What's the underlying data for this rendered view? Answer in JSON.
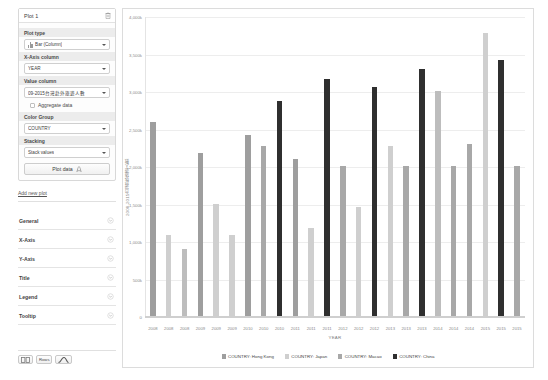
{
  "sidebar": {
    "plot_card": {
      "title": "Plot 1",
      "delete_icon": "trash-icon",
      "fields": [
        {
          "label": "Plot type",
          "value": "Bar (Column)",
          "icon": "bar-chart-icon"
        },
        {
          "label": "X-Axis column",
          "value": "YEAR"
        },
        {
          "label": "Value column",
          "value": "09-2015台灣赴外旅遊人數"
        },
        {
          "label": "Color Group",
          "value": "COUNTRY"
        },
        {
          "label": "Stacking",
          "value": "Stack values"
        }
      ],
      "checkbox": {
        "label": "Aggregate data",
        "checked": false
      },
      "plot_button": {
        "label": "Plot data",
        "icon": "rocket-icon"
      }
    },
    "add_new_plot": "Add new plot",
    "sections": [
      {
        "label": "General",
        "expanded": false
      },
      {
        "label": "X-Axis",
        "expanded": false
      },
      {
        "label": "Y-Axis",
        "expanded": false
      },
      {
        "label": "Title",
        "expanded": false
      },
      {
        "label": "Legend",
        "expanded": false
      },
      {
        "label": "Tooltip",
        "expanded": false
      }
    ],
    "bottom_buttons": [
      {
        "name": "grid-view-button",
        "glyph": "▮▮"
      },
      {
        "name": "rows-button",
        "glyph": "Rows"
      },
      {
        "name": "chart-view-button",
        "glyph": "chart-icon"
      }
    ]
  },
  "colors": {
    "hong_kong": "#9e9e9e",
    "japan": "#cfcfcf",
    "macao": "#a8a8a8",
    "china": "#2f2f2f",
    "gridline": "#ededed",
    "axis": "#cfcfcf"
  },
  "chart_data": {
    "type": "bar",
    "title": "",
    "xlabel": "YEAR",
    "ylabel": "2008-2015台灣赴外旅遊人數",
    "ylim": [
      0,
      4000
    ],
    "yticks": [
      0,
      500,
      1000,
      1500,
      2000,
      2500,
      3000,
      3500,
      4000
    ],
    "ytick_labels": [
      "0",
      "500k",
      "1,000k",
      "1,500k",
      "2,000k",
      "2,500k",
      "3,000k",
      "3,500k",
      "4,000k"
    ],
    "grid": true,
    "legend_position": "bottom",
    "unit": "k",
    "categories": [
      "2008",
      "2008",
      "2008",
      "2009",
      "2009",
      "2009",
      "2010",
      "2010",
      "2010",
      "2011",
      "2011",
      "2011",
      "2012",
      "2012",
      "2012",
      "2013",
      "2013",
      "2013",
      "2014",
      "2014",
      "2014",
      "2015",
      "2015",
      "2015"
    ],
    "legend": [
      {
        "label": "COUNTRY: Hong Kong",
        "color": "#9e9e9e"
      },
      {
        "label": "COUNTRY: Japan",
        "color": "#cfcfcf"
      },
      {
        "label": "COUNTRY: Macao",
        "color": "#a8a8a8"
      },
      {
        "label": "COUNTRY: China",
        "color": "#2f2f2f"
      }
    ],
    "bars": [
      {
        "year": "2008",
        "series": "COUNTRY: Hong Kong",
        "value": 2600,
        "color": "#9e9e9e"
      },
      {
        "year": "2008",
        "series": "COUNTRY: Japan",
        "value": 1090,
        "color": "#cfcfcf"
      },
      {
        "year": "2008",
        "series": "COUNTRY: Macao",
        "value": 890,
        "color": "#bdbdbd"
      },
      {
        "year": "2009",
        "series": "COUNTRY: Hong Kong",
        "value": 2180,
        "color": "#9e9e9e"
      },
      {
        "year": "2009",
        "series": "COUNTRY: Japan",
        "value": 1500,
        "color": "#cfcfcf"
      },
      {
        "year": "2009",
        "series": "COUNTRY: Macao",
        "value": 1090,
        "color": "#cfcfcf"
      },
      {
        "year": "2010",
        "series": "COUNTRY: Hong Kong",
        "value": 2420,
        "color": "#9e9e9e"
      },
      {
        "year": "2010",
        "series": "COUNTRY: Japan",
        "value": 2280,
        "color": "#a8a8a8"
      },
      {
        "year": "2010",
        "series": "COUNTRY: China",
        "value": 2880,
        "color": "#2f2f2f"
      },
      {
        "year": "2011",
        "series": "COUNTRY: Hong Kong",
        "value": 2100,
        "color": "#9e9e9e"
      },
      {
        "year": "2011",
        "series": "COUNTRY: Japan",
        "value": 1180,
        "color": "#cfcfcf"
      },
      {
        "year": "2011",
        "series": "COUNTRY: China",
        "value": 3170,
        "color": "#2f2f2f"
      },
      {
        "year": "2012",
        "series": "COUNTRY: Hong Kong",
        "value": 2010,
        "color": "#a8a8a8"
      },
      {
        "year": "2012",
        "series": "COUNTRY: Japan",
        "value": 1460,
        "color": "#cfcfcf"
      },
      {
        "year": "2012",
        "series": "COUNTRY: China",
        "value": 3070,
        "color": "#2f2f2f"
      },
      {
        "year": "2013",
        "series": "COUNTRY: Hong Kong",
        "value": 2280,
        "color": "#cfcfcf"
      },
      {
        "year": "2013",
        "series": "COUNTRY: Japan",
        "value": 2010,
        "color": "#a8a8a8"
      },
      {
        "year": "2013",
        "series": "COUNTRY: China",
        "value": 3310,
        "color": "#2f2f2f"
      },
      {
        "year": "2014",
        "series": "COUNTRY: Hong Kong",
        "value": 3010,
        "color": "#bdbdbd"
      },
      {
        "year": "2014",
        "series": "COUNTRY: Japan",
        "value": 2010,
        "color": "#a8a8a8"
      },
      {
        "year": "2014",
        "series": "COUNTRY: China",
        "value": 2300,
        "color": "#a8a8a8"
      },
      {
        "year": "2015",
        "series": "COUNTRY: Hong Kong",
        "value": 3790,
        "color": "#cfcfcf"
      },
      {
        "year": "2015",
        "series": "COUNTRY: China",
        "value": 3420,
        "color": "#2f2f2f"
      },
      {
        "year": "2015",
        "series": "COUNTRY: Macao",
        "value": 2010,
        "color": "#a8a8a8"
      }
    ]
  }
}
